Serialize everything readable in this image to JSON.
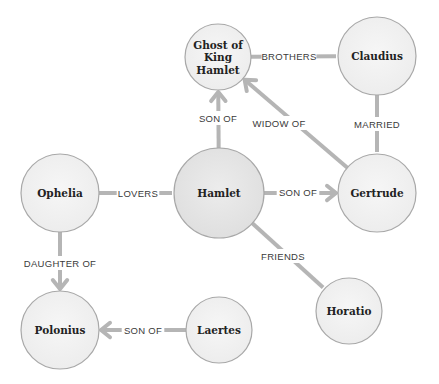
{
  "diagram": {
    "type": "relationship-graph",
    "nodes": [
      {
        "id": "ghost",
        "label_lines": [
          "Ghost of",
          "King",
          "Hamlet"
        ],
        "cx": 218,
        "cy": 57,
        "r": 33
      },
      {
        "id": "claudius",
        "label_lines": [
          "Claudius"
        ],
        "cx": 377,
        "cy": 56,
        "r": 39
      },
      {
        "id": "ophelia",
        "label_lines": [
          "Ophelia"
        ],
        "cx": 60,
        "cy": 193,
        "r": 39
      },
      {
        "id": "hamlet",
        "label_lines": [
          "Hamlet"
        ],
        "cx": 219,
        "cy": 193,
        "r": 45
      },
      {
        "id": "gertrude",
        "label_lines": [
          "Gertrude"
        ],
        "cx": 377,
        "cy": 193,
        "r": 39
      },
      {
        "id": "polonius",
        "label_lines": [
          "Polonius"
        ],
        "cx": 60,
        "cy": 330,
        "r": 39
      },
      {
        "id": "laertes",
        "label_lines": [
          "Laertes"
        ],
        "cx": 219,
        "cy": 330,
        "r": 33
      },
      {
        "id": "horatio",
        "label_lines": [
          "Horatio"
        ],
        "cx": 349,
        "cy": 311,
        "r": 33
      }
    ],
    "edges": [
      {
        "from": "ghost",
        "to": "claudius",
        "label": "BROTHERS",
        "arrow": false,
        "lx": 289,
        "ly": 56
      },
      {
        "from": "hamlet",
        "to": "ghost",
        "label": "SON OF",
        "arrow": true,
        "lx": 218,
        "ly": 118
      },
      {
        "from": "gertrude",
        "to": "ghost",
        "label": "WIDOW OF",
        "arrow": true,
        "lx": 279,
        "ly": 123
      },
      {
        "from": "claudius",
        "to": "gertrude",
        "label": "MARRIED",
        "arrow": false,
        "lx": 377,
        "ly": 124
      },
      {
        "from": "ophelia",
        "to": "hamlet",
        "label": "LOVERS",
        "arrow": false,
        "lx": 138,
        "ly": 193
      },
      {
        "from": "hamlet",
        "to": "gertrude",
        "label": "SON OF",
        "arrow": true,
        "lx": 298,
        "ly": 192
      },
      {
        "from": "hamlet",
        "to": "horatio",
        "label": "FRIENDS",
        "arrow": false,
        "lx": 283,
        "ly": 256
      },
      {
        "from": "ophelia",
        "to": "polonius",
        "label": "DAUGHTER OF",
        "arrow": true,
        "lx": 60,
        "ly": 263
      },
      {
        "from": "laertes",
        "to": "polonius",
        "label": "SON OF",
        "arrow": true,
        "lx": 143,
        "ly": 330
      }
    ]
  },
  "colors": {
    "background": "#ffffff",
    "node_fill": "#f2f2f2",
    "node_fill_center": "#e9e9e9",
    "node_stroke": "#a8a8a8",
    "edge": "#b5b5b5",
    "node_text": "#222222",
    "edge_text": "#3a3a3a"
  }
}
